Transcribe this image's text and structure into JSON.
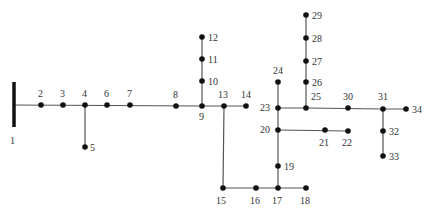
{
  "diagram": {
    "type": "radial distribution network single-line diagram",
    "busbar": {
      "id": "1",
      "x": 14,
      "y1": 82,
      "y2": 127,
      "label": {
        "text": "1",
        "x": 10,
        "y": 144
      }
    },
    "nodes": [
      {
        "id": "2",
        "x": 41,
        "y": 105,
        "lx": 38,
        "ly": 97,
        "anchor": "start"
      },
      {
        "id": "3",
        "x": 63,
        "y": 105,
        "lx": 60,
        "ly": 97,
        "anchor": "start"
      },
      {
        "id": "4",
        "x": 85,
        "y": 105,
        "lx": 82,
        "ly": 97,
        "anchor": "start"
      },
      {
        "id": "5",
        "x": 85,
        "y": 147,
        "lx": 90,
        "ly": 151,
        "anchor": "start"
      },
      {
        "id": "6",
        "x": 107,
        "y": 105,
        "lx": 104,
        "ly": 97,
        "anchor": "start"
      },
      {
        "id": "7",
        "x": 130,
        "y": 105,
        "lx": 127,
        "ly": 97,
        "anchor": "start"
      },
      {
        "id": "8",
        "x": 176,
        "y": 106,
        "lx": 173,
        "ly": 98,
        "anchor": "start"
      },
      {
        "id": "9",
        "x": 202,
        "y": 106,
        "lx": 199,
        "ly": 120,
        "anchor": "start"
      },
      {
        "id": "10",
        "x": 202,
        "y": 81,
        "lx": 208,
        "ly": 85,
        "anchor": "start"
      },
      {
        "id": "11",
        "x": 202,
        "y": 59,
        "lx": 208,
        "ly": 63,
        "anchor": "start"
      },
      {
        "id": "12",
        "x": 202,
        "y": 37,
        "lx": 208,
        "ly": 41,
        "anchor": "start"
      },
      {
        "id": "13",
        "x": 224,
        "y": 106,
        "lx": 218,
        "ly": 98,
        "anchor": "start"
      },
      {
        "id": "14",
        "x": 246,
        "y": 106,
        "lx": 241,
        "ly": 98,
        "anchor": "start"
      },
      {
        "id": "15",
        "x": 223,
        "y": 188,
        "lx": 216,
        "ly": 204,
        "anchor": "start"
      },
      {
        "id": "16",
        "x": 256,
        "y": 188,
        "lx": 250,
        "ly": 204,
        "anchor": "start"
      },
      {
        "id": "17",
        "x": 278,
        "y": 188,
        "lx": 272,
        "ly": 204,
        "anchor": "start"
      },
      {
        "id": "18",
        "x": 306,
        "y": 188,
        "lx": 300,
        "ly": 204,
        "anchor": "start"
      },
      {
        "id": "19",
        "x": 278,
        "y": 166,
        "lx": 284,
        "ly": 170,
        "anchor": "start"
      },
      {
        "id": "20",
        "x": 278,
        "y": 130,
        "lx": 260,
        "ly": 133,
        "anchor": "start"
      },
      {
        "id": "21",
        "x": 325,
        "y": 130,
        "lx": 319,
        "ly": 146,
        "anchor": "start"
      },
      {
        "id": "22",
        "x": 348,
        "y": 131,
        "lx": 342,
        "ly": 146,
        "anchor": "start"
      },
      {
        "id": "23",
        "x": 278,
        "y": 108,
        "lx": 260,
        "ly": 111,
        "anchor": "start"
      },
      {
        "id": "24",
        "x": 278,
        "y": 82,
        "lx": 273,
        "ly": 74,
        "anchor": "start"
      },
      {
        "id": "25",
        "x": 306,
        "y": 108,
        "lx": 311,
        "ly": 100,
        "anchor": "start"
      },
      {
        "id": "26",
        "x": 306,
        "y": 82,
        "lx": 312,
        "ly": 86,
        "anchor": "start"
      },
      {
        "id": "27",
        "x": 306,
        "y": 61,
        "lx": 312,
        "ly": 65,
        "anchor": "start"
      },
      {
        "id": "28",
        "x": 306,
        "y": 38,
        "lx": 312,
        "ly": 42,
        "anchor": "start"
      },
      {
        "id": "29",
        "x": 306,
        "y": 15,
        "lx": 312,
        "ly": 19,
        "anchor": "start"
      },
      {
        "id": "30",
        "x": 348,
        "y": 108,
        "lx": 343,
        "ly": 100,
        "anchor": "start"
      },
      {
        "id": "31",
        "x": 383,
        "y": 109,
        "lx": 378,
        "ly": 100,
        "anchor": "start"
      },
      {
        "id": "32",
        "x": 383,
        "y": 131,
        "lx": 389,
        "ly": 135,
        "anchor": "start"
      },
      {
        "id": "33",
        "x": 383,
        "y": 156,
        "lx": 389,
        "ly": 160,
        "anchor": "start"
      },
      {
        "id": "34",
        "x": 406,
        "y": 109,
        "lx": 412,
        "ly": 113,
        "anchor": "start"
      }
    ],
    "edges": [
      {
        "points": "14,105 202,106 246,106"
      },
      {
        "points": "85,105 85,147"
      },
      {
        "points": "202,106 202,37"
      },
      {
        "points": "224,106 223,188 306,188"
      },
      {
        "points": "278,188 278,108"
      },
      {
        "points": "278,130 348,131"
      },
      {
        "points": "278,108 278,82"
      },
      {
        "points": "278,108 306,108 383,109 406,109"
      },
      {
        "points": "306,108 306,15"
      },
      {
        "points": "383,109 383,156"
      }
    ]
  }
}
